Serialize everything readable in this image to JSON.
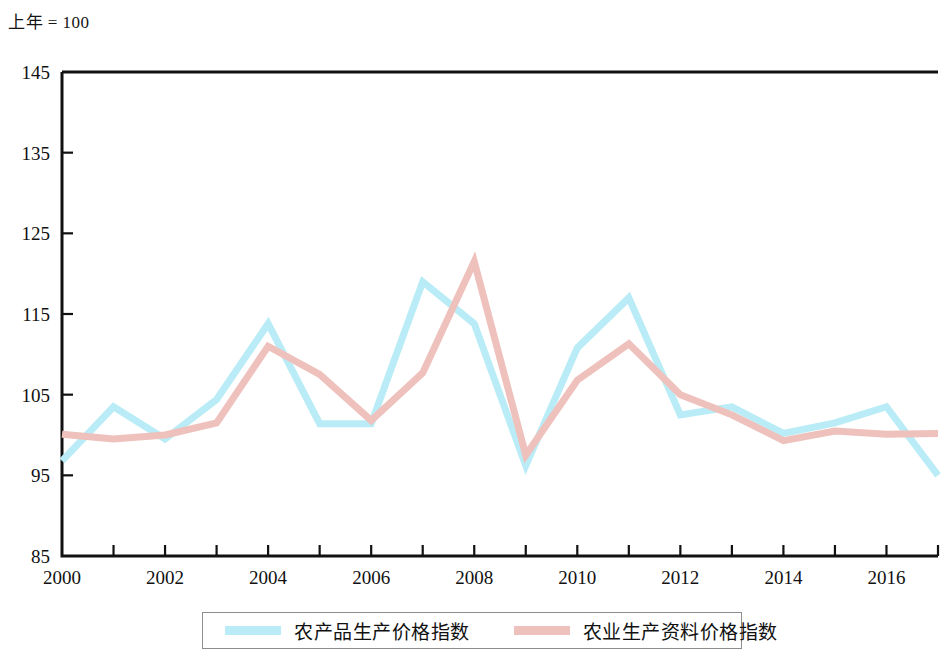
{
  "header": {
    "unit_note": "上年 = 100"
  },
  "legend": {
    "position": "bottom",
    "items": [
      {
        "label": "农产品生产价格指数",
        "color": "#b9ecf6"
      },
      {
        "label": "农业生产资料价格指数",
        "color": "#efc1bc"
      }
    ]
  },
  "chart_data": {
    "type": "line",
    "title": "",
    "subtitle": "",
    "xlabel": "",
    "ylabel": "",
    "unit_note": "上年 = 100",
    "grid": false,
    "legend_position": "bottom",
    "x": [
      2000,
      2001,
      2002,
      2003,
      2004,
      2005,
      2006,
      2007,
      2008,
      2009,
      2010,
      2011,
      2012,
      2013,
      2014,
      2015,
      2016,
      2017
    ],
    "xlim": [
      2000,
      2017
    ],
    "ylim": [
      85,
      145
    ],
    "yticks": [
      85,
      95,
      105,
      115,
      125,
      135,
      145
    ],
    "xticks": [
      2000,
      2001,
      2002,
      2003,
      2004,
      2005,
      2006,
      2007,
      2008,
      2009,
      2010,
      2011,
      2012,
      2013,
      2014,
      2015,
      2016,
      2017
    ],
    "xtick_labels": [
      "2000",
      "",
      "2002",
      "",
      "2004",
      "",
      "2006",
      "",
      "2008",
      "",
      "2010",
      "",
      "2012",
      "",
      "2014",
      "",
      "2016",
      ""
    ],
    "ytick_labels": [
      "85",
      "95",
      "105",
      "115",
      "125",
      "135",
      "145"
    ],
    "series": [
      {
        "name": "农产品生产价格指数",
        "color": "#b9ecf6",
        "values": [
          96.8,
          103.5,
          99.5,
          104.4,
          113.8,
          101.4,
          101.4,
          119.0,
          113.8,
          96.2,
          110.8,
          117.0,
          102.5,
          103.5,
          100.2,
          101.5,
          103.5,
          95.0
        ]
      },
      {
        "name": "农业生产资料价格指数",
        "color": "#efc1bc",
        "values": [
          100.1,
          99.5,
          100.0,
          101.5,
          111.0,
          107.5,
          101.8,
          107.7,
          121.5,
          97.5,
          106.8,
          111.3,
          105.0,
          102.5,
          99.3,
          100.5,
          100.1,
          100.2
        ]
      }
    ]
  }
}
